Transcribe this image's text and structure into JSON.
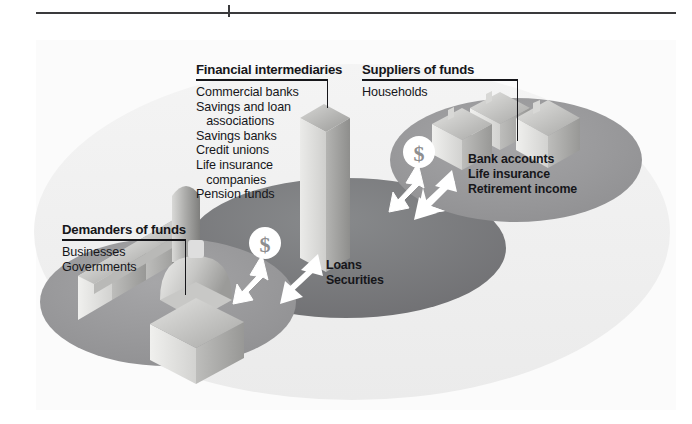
{
  "figure": {
    "title_rule": "horizontal-rule",
    "background_color": "#fbfbfb"
  },
  "labels": {
    "financial_intermediaries": {
      "heading": "Financial intermediaries",
      "items": [
        "Commercial banks",
        "Savings and loan",
        "   associations",
        "Savings banks",
        "Credit unions",
        "Life insurance",
        "   companies",
        "Pension funds"
      ],
      "items_text": "Commercial banks\nSavings and loan\n   associations\nSavings banks\nCredit unions\nLife insurance\n   companies\nPension funds"
    },
    "suppliers_of_funds": {
      "heading": "Suppliers of funds",
      "items": [
        "Households"
      ],
      "items_text": "Households"
    },
    "demanders_of_funds": {
      "heading": "Demanders of funds",
      "items": [
        "Businesses",
        "Governments"
      ],
      "items_text": "Businesses\nGovernments"
    },
    "supplier_products": {
      "items": [
        "Bank accounts",
        "Life insurance",
        "Retirement income"
      ],
      "items_text": "Bank accounts\nLife insurance\nRetirement income"
    },
    "demander_products": {
      "items": [
        "Loans",
        "Securities"
      ],
      "items_text": "Loans\nSecurities"
    }
  },
  "flow_markers": {
    "money_left": "$",
    "money_right": "$"
  },
  "colors": {
    "page_background": "#ffffff",
    "figure_background": "#fbfbfb",
    "rule": "#3a3a3c",
    "text": "#16161a",
    "backdrop_ellipse": "#f0f0f0",
    "side_ellipse": "#9a9a9c",
    "center_ellipse": "#7c7c7e",
    "building_light": "#e8e8e6",
    "building_mid": "#c3c3c1",
    "building_dark": "#9d9d9b",
    "arrow_white": "#ffffff",
    "dollar_circle": "#ffffff",
    "dollar_glyph": "#8e8e90"
  },
  "icon_names": {
    "skyscraper": "skyscraper-icon",
    "factory": "factory-icon",
    "silo": "silo-icon",
    "dome": "dome-building-icon",
    "house": "house-icon",
    "dollar_badge": "dollar-badge-icon",
    "flow_arrow": "double-arrow-icon"
  }
}
